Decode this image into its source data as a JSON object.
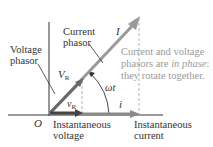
{
  "labels": {
    "current_phasor": [
      "Current",
      "phasor"
    ],
    "voltage_phasor": [
      "Voltage",
      "phasor"
    ],
    "current_symbol": "I",
    "voltage_symbol": "V",
    "voltage_symbol_sub": "R",
    "inst_voltage_symbol": "v",
    "inst_voltage_sub": "R",
    "inst_current_symbol": "i",
    "angle": "ωt",
    "origin": "O",
    "instantaneous_voltage": [
      "Instantaneous",
      "voltage"
    ],
    "instantaneous_current": [
      "Instantaneous",
      "current"
    ]
  },
  "note": {
    "line1": "Current and voltage",
    "line2_pre": "phasors are ",
    "line2_em": "in phase",
    "line2_post": ":",
    "line3": "they rotate together."
  },
  "colors": {
    "axis": "#333333",
    "current_phasor": "#9a9a9a",
    "voltage_phasor": "#5a5a5a",
    "dashed": "#aaaaaa",
    "note_text": "#9a9a9a"
  }
}
